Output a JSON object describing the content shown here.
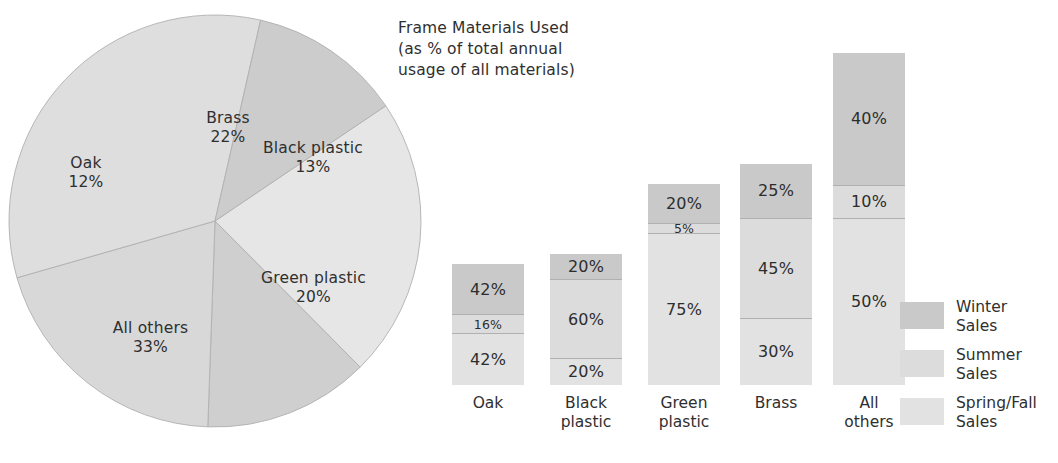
{
  "title": {
    "lines": [
      "Frame Materials Used",
      "(as % of total annual",
      "usage of all materials)"
    ]
  },
  "colors": {
    "winter": "#c9c9c9",
    "summer": "#dcdcdc",
    "springfall": "#e2e2e2",
    "pie_brass": "#e6e6e6",
    "pie_black_plastic": "#cfcfcf",
    "pie_green_plastic": "#d8d8d8",
    "pie_all_others": "#dedede",
    "pie_oak": "#cccccc",
    "stroke": "#b0b0b0",
    "text": "#2f2f2f"
  },
  "chart_data": [
    {
      "type": "pie",
      "title": "Frame Materials Used (as % of total annual usage of all materials)",
      "unit": "%",
      "start_angle_deg": -34,
      "slices": [
        {
          "name": "Brass",
          "label": "Brass",
          "pct_label": "22%",
          "value": 22,
          "color": "#e6e6e6"
        },
        {
          "name": "Black plastic",
          "label": "Black plastic",
          "pct_label": "13%",
          "value": 13,
          "color": "#cfcfcf"
        },
        {
          "name": "Green plastic",
          "label": "Green plastic",
          "pct_label": "20%",
          "value": 20,
          "color": "#d8d8d8"
        },
        {
          "name": "All others",
          "label": "All others",
          "pct_label": "33%",
          "value": 33,
          "color": "#dedede"
        },
        {
          "name": "Oak",
          "label": "Oak",
          "pct_label": "12%",
          "value": 12,
          "color": "#cccccc"
        }
      ]
    },
    {
      "type": "bar",
      "subtype": "stacked",
      "stacked_normalized": true,
      "note": "Bar total height is proportional to the material share of total annual usage; segments are % of that material's own sales by season.",
      "categories": [
        "Oak",
        "Black plastic",
        "Green plastic",
        "Brass",
        "All others"
      ],
      "category_lines": [
        [
          "Oak"
        ],
        [
          "Black",
          "plastic"
        ],
        [
          "Green",
          "plastic"
        ],
        [
          "Brass"
        ],
        [
          "All",
          "others"
        ]
      ],
      "totals_pct_of_usage": [
        12,
        13,
        20,
        22,
        33
      ],
      "series": [
        {
          "name": "Winter Sales",
          "color": "#c9c9c9",
          "values": [
            42,
            20,
            20,
            25,
            40
          ]
        },
        {
          "name": "Summer Sales",
          "color": "#dcdcdc",
          "values": [
            16,
            60,
            5,
            45,
            10
          ]
        },
        {
          "name": "Spring/Fall Sales",
          "color": "#e2e2e2",
          "values": [
            42,
            20,
            75,
            30,
            50
          ]
        }
      ],
      "value_labels": [
        [
          "42%",
          "16%",
          "42%"
        ],
        [
          "20%",
          "60%",
          "20%"
        ],
        [
          "20%",
          "5%",
          "75%"
        ],
        [
          "25%",
          "45%",
          "30%"
        ],
        [
          "40%",
          "10%",
          "50%"
        ]
      ],
      "xlabel": "",
      "ylabel": "",
      "grid": false,
      "legend_position": "right"
    }
  ],
  "legend": {
    "items": [
      {
        "swatch": "winter",
        "lines": [
          "Winter",
          "Sales"
        ]
      },
      {
        "swatch": "summer",
        "lines": [
          "Summer",
          "Sales"
        ]
      },
      {
        "swatch": "springfall",
        "lines": [
          "Spring/Fall",
          "Sales"
        ]
      }
    ]
  }
}
